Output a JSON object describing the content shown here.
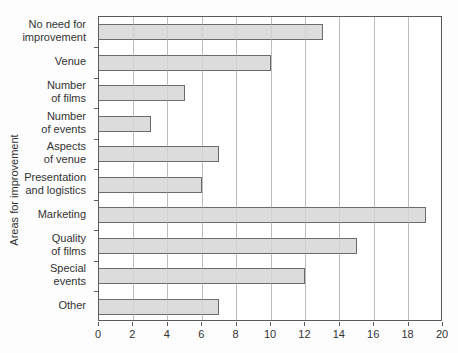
{
  "chart_data": {
    "type": "bar",
    "orientation": "horizontal",
    "title": "",
    "xlabel": "",
    "ylabel": "Areas for improvement",
    "categories": [
      "No need for\nimprovement",
      "Venue",
      "Number\nof films",
      "Number\nof events",
      "Aspects\nof venue",
      "Presentation\nand logistics",
      "Marketing",
      "Quality\nof films",
      "Special\nevents",
      "Other"
    ],
    "values": [
      13,
      10,
      5,
      3,
      7,
      6,
      19,
      15,
      12,
      7
    ],
    "xlim": [
      0,
      20
    ],
    "xticks": [
      0,
      2,
      4,
      6,
      8,
      10,
      12,
      14,
      16,
      18,
      20
    ],
    "grid": true,
    "legend": false,
    "colors": {
      "background": "#fdfdfd",
      "bar_fill": "#dcdcdc",
      "bar_border": "#6b6b6b",
      "gridline": "#bcbcbc",
      "frame": "#5a5a5a",
      "text": "#333333"
    }
  }
}
